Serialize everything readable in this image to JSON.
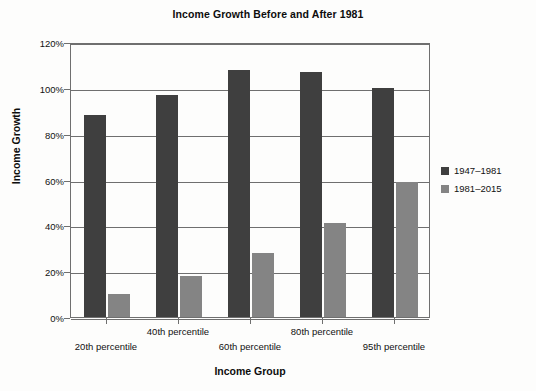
{
  "chart_data": {
    "type": "bar",
    "title": "Income Growth Before and After 1981",
    "xlabel": "Income Group",
    "ylabel": "Income Growth",
    "categories": [
      "20th percentile",
      "40th percentile",
      "60th percentile",
      "80th percentile",
      "95th percentile"
    ],
    "series": [
      {
        "name": "1947–1981",
        "color": "#3f3f3f",
        "values": [
          88,
          97,
          108,
          107,
          100
        ]
      },
      {
        "name": "1981–2015",
        "color": "#848484",
        "values": [
          10,
          18,
          28,
          41,
          59
        ]
      }
    ],
    "ylim": [
      0,
      120
    ],
    "ytick_values": [
      0,
      20,
      40,
      60,
      80,
      100,
      120
    ],
    "ytick_labels": [
      "0%",
      "20%",
      "40%",
      "60%",
      "80%",
      "100%",
      "120%"
    ],
    "grid": true,
    "legend_position": "right",
    "value_unit": "%"
  }
}
